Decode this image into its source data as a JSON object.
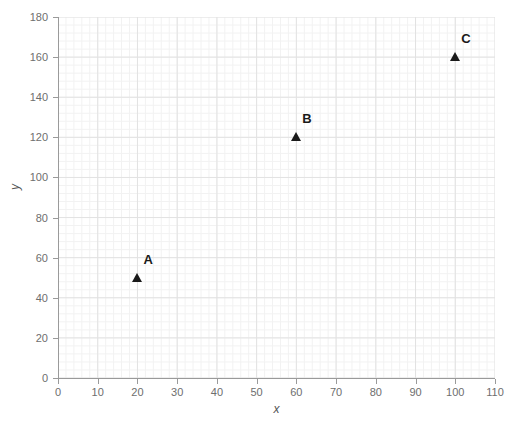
{
  "chart_data": {
    "type": "scatter",
    "title": "",
    "xlabel": "x",
    "ylabel": "y",
    "xlim": [
      0,
      110
    ],
    "ylim": [
      0,
      180
    ],
    "xticks": [
      0,
      10,
      20,
      30,
      40,
      50,
      60,
      70,
      80,
      90,
      100,
      110
    ],
    "yticks": [
      0,
      20,
      40,
      60,
      80,
      100,
      120,
      140,
      160,
      180
    ],
    "grid": true,
    "legend": "none",
    "marker": "triangle",
    "marker_color": "#1a1a1a",
    "points": [
      {
        "label": "A",
        "x": 20,
        "y": 50
      },
      {
        "label": "B",
        "x": 60,
        "y": 120
      },
      {
        "label": "C",
        "x": 100,
        "y": 160
      }
    ]
  },
  "colors": {
    "axis": "#9a9a9a",
    "grid_major": "#e2e2e2",
    "grid_minor": "#f2f2f2",
    "tick_text": "#6e6e6e",
    "axis_title": "#555555",
    "marker": "#1a1a1a",
    "background": "#ffffff"
  }
}
